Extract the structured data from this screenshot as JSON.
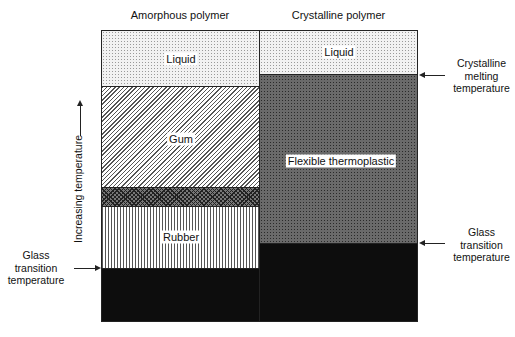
{
  "columns": {
    "amorphous": {
      "title": "Amorphous polymer"
    },
    "crystalline": {
      "title": "Crystalline polymer"
    }
  },
  "regions": {
    "amorphous": {
      "liquid": "Liquid",
      "gum": "Gum",
      "rubber": "Rubber"
    },
    "crystalline": {
      "liquid": "Liquid",
      "flexible": "Flexible thermoplastic"
    }
  },
  "axis": {
    "label": "Increasing temperature"
  },
  "annotations": {
    "left_glass": "Glass\ntransition\ntemperature",
    "right_melting": "Crystalline\nmelting\ntemperature",
    "right_glass": "Glass\ntransition\ntemperature"
  },
  "colors": {
    "outline": "#222222",
    "solid": "#0d0d0d"
  }
}
